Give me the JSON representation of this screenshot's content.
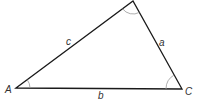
{
  "diagram": {
    "type": "triangle",
    "vertices": [
      {
        "name": "A",
        "x": 16,
        "y": 88
      },
      {
        "name": "B",
        "x": 133,
        "y": 1
      },
      {
        "name": "C",
        "x": 182,
        "y": 89
      }
    ],
    "vertex_labels": {
      "A": "A",
      "C": "C"
    },
    "side_labels": {
      "a": "a",
      "b": "b",
      "c": "c"
    },
    "angle_arcs": [
      "A",
      "B",
      "C"
    ],
    "colors": {
      "stroke": "#1a1a1a",
      "arc": "#999999",
      "text": "#333333"
    }
  }
}
